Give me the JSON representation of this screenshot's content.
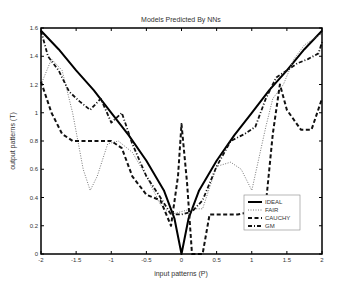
{
  "chart_data": {
    "type": "line",
    "title": "Models Predicted By NNs",
    "xlabel": "input patterns (P)",
    "ylabel": "output patterns (T)",
    "xlim": [
      -2,
      2
    ],
    "ylim": [
      0,
      1.6
    ],
    "xticks": [
      "-2",
      "-1.5",
      "-1",
      "-0.5",
      "0",
      "0.5",
      "1",
      "1.5",
      "2"
    ],
    "yticks": [
      "0",
      "0.2",
      "0.4",
      "0.6",
      "0.8",
      "1",
      "1.2",
      "1.4",
      "1.6"
    ],
    "grid": false,
    "legend_position": "lower right",
    "series": [
      {
        "name": "IDEAL",
        "style": "solid",
        "x": [
          -2,
          -1.75,
          -1.5,
          -1.25,
          -1,
          -0.75,
          -0.5,
          -0.25,
          -0.1,
          0,
          0.1,
          0.25,
          0.5,
          0.75,
          1,
          1.25,
          1.5,
          1.75,
          2
        ],
        "y": [
          1.58,
          1.45,
          1.3,
          1.16,
          1.0,
          0.84,
          0.66,
          0.45,
          0.25,
          0.0,
          0.25,
          0.45,
          0.66,
          0.84,
          1.0,
          1.16,
          1.3,
          1.45,
          1.58
        ]
      },
      {
        "name": "FAIR",
        "style": "dotted",
        "x": [
          -2,
          -1.85,
          -1.7,
          -1.55,
          -1.4,
          -1.3,
          -1.2,
          -1.05,
          -0.9,
          -0.7,
          -0.5,
          -0.3,
          -0.15,
          0,
          0.15,
          0.3,
          0.5,
          0.7,
          0.85,
          1.0,
          1.2,
          1.3,
          1.45,
          1.6,
          1.75,
          1.9,
          2
        ],
        "y": [
          1.2,
          1.38,
          1.3,
          1.0,
          0.6,
          0.45,
          0.55,
          0.78,
          0.8,
          0.72,
          0.55,
          0.35,
          0.28,
          0.3,
          0.32,
          0.32,
          0.62,
          0.65,
          0.6,
          0.45,
          0.9,
          1.1,
          1.2,
          1.38,
          1.48,
          1.53,
          1.56
        ]
      },
      {
        "name": "CAUCHY",
        "style": "dashed",
        "x": [
          -2,
          -1.85,
          -1.7,
          -1.55,
          -1.4,
          -1.2,
          -1.0,
          -0.85,
          -0.7,
          -0.5,
          -0.3,
          -0.15,
          -0.05,
          0.0,
          0.08,
          0.15,
          0.25,
          0.3,
          0.4,
          0.5,
          0.8,
          1.0,
          1.2,
          1.3,
          1.4,
          1.5,
          1.7,
          1.85,
          2
        ],
        "y": [
          1.22,
          1.0,
          0.85,
          0.8,
          0.8,
          0.8,
          0.8,
          0.75,
          0.55,
          0.42,
          0.38,
          0.2,
          0.55,
          0.92,
          0.5,
          0.0,
          0.0,
          0.0,
          0.28,
          0.28,
          0.28,
          0.3,
          0.35,
          0.85,
          1.2,
          1.02,
          0.88,
          0.88,
          1.1
        ]
      },
      {
        "name": "GM",
        "style": "dashdot",
        "x": [
          -2,
          -1.9,
          -1.75,
          -1.6,
          -1.45,
          -1.3,
          -1.15,
          -1.0,
          -0.85,
          -0.7,
          -0.5,
          -0.3,
          -0.15,
          0.0,
          0.15,
          0.3,
          0.5,
          0.7,
          0.9,
          1.05,
          1.2,
          1.35,
          1.5,
          1.65,
          1.8,
          1.95,
          2
        ],
        "y": [
          1.58,
          1.4,
          1.3,
          1.15,
          1.08,
          1.02,
          1.1,
          0.93,
          1.0,
          0.78,
          0.55,
          0.4,
          0.28,
          0.28,
          0.3,
          0.38,
          0.62,
          0.8,
          0.85,
          0.9,
          1.1,
          1.25,
          1.3,
          1.35,
          1.38,
          1.42,
          1.5
        ]
      }
    ]
  }
}
